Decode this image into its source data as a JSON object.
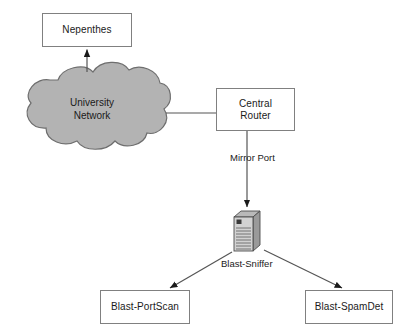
{
  "diagram": {
    "background_color": "#ffffff",
    "line_color": "#555555",
    "cloud_fill": "#b3b3b3",
    "cloud_stroke": "#6e6e6e",
    "box_stroke": "#808080",
    "text_color": "#1a1a1a",
    "nodes": {
      "nepenthes": {
        "label": "Nepenthes",
        "shape": "rectangle"
      },
      "university_network": {
        "label": "University\nNetwork",
        "shape": "cloud"
      },
      "central_router": {
        "label": "Central\nRouter",
        "shape": "rectangle"
      },
      "blast_sniffer": {
        "label": "Blast-Sniffer",
        "shape": "server-icon"
      },
      "blast_portscan": {
        "label": "Blast-PortScan",
        "shape": "rectangle"
      },
      "blast_spamdet": {
        "label": "Blast-SpamDet",
        "shape": "rectangle"
      }
    },
    "edge_labels": {
      "mirror_port": "Mirror Port"
    },
    "icons": {
      "server": "server-tower-icon"
    }
  }
}
